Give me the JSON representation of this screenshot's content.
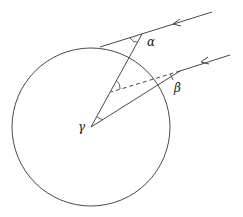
{
  "diagram": {
    "type": "geometry-refraction",
    "stroke_color": "#333333",
    "background": "#ffffff",
    "circle": {
      "cx": 91,
      "cy": 127,
      "r": 79
    },
    "upper_ray": {
      "from": [
        212,
        12
      ],
      "to": [
        100,
        47
      ]
    },
    "radial_line": {
      "from": [
        91,
        127
      ],
      "to": [
        142,
        34
      ]
    },
    "lower_ray": {
      "from": [
        230,
        55
      ],
      "to": [
        180,
        71
      ]
    },
    "refracted_ray": {
      "from": [
        180,
        71
      ],
      "to": [
        91,
        127
      ]
    },
    "dashed_line": {
      "from": [
        180,
        71
      ],
      "to": [
        111,
        92
      ]
    },
    "labels": {
      "alpha": "α",
      "beta": "β",
      "gamma": "γ"
    }
  }
}
